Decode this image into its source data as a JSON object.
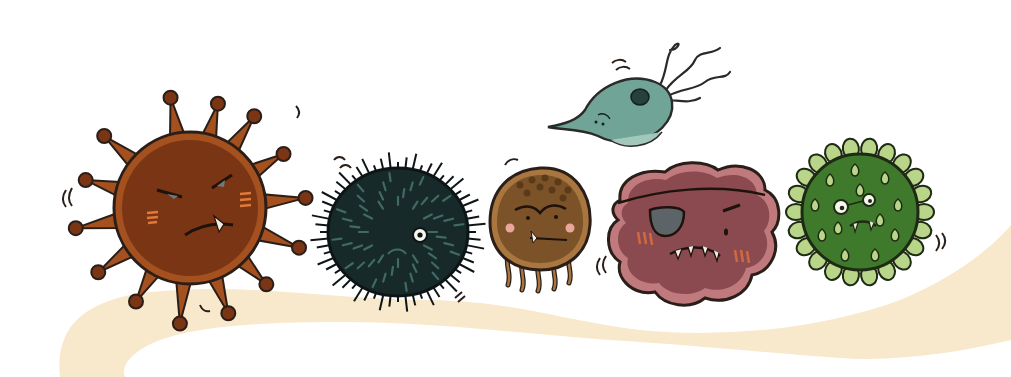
{
  "illustration": {
    "title": "Cartoon microbes",
    "background_color": "#ffffff",
    "path_color": "#f8e8cc",
    "outline_color": "#2a1e18",
    "characters": [
      {
        "id": "brown-spiky-virus",
        "description": "Brown round virus with knobbed spikes, grumpy face",
        "body_color": "#7a3514",
        "highlight_color": "#a4501f",
        "cheek_color": "#d9773a"
      },
      {
        "id": "black-spiny-microbe",
        "description": "Dark spiny ball with one white eye",
        "body_color": "#18292a",
        "spine_color": "#3f6b62"
      },
      {
        "id": "brown-tentacled-microbe",
        "description": "Brown round microbe with small tentacles and one fang",
        "body_color": "#7c5228",
        "rim_color": "#a8763e",
        "cheek_color": "#e8a79a"
      },
      {
        "id": "teal-flagellate",
        "description": "Teal flagellated protozoan floating above",
        "body_color": "#6fa496",
        "nucleus_color": "#26403b"
      },
      {
        "id": "mauve-pirate-blob",
        "description": "Mauve blob with eye patch and jagged teeth",
        "body_color": "#8a4a50",
        "rim_color": "#c07a7e",
        "patch_color": "#5d6467",
        "cheek_color": "#d06a3e"
      },
      {
        "id": "green-virus",
        "description": "Green spherical virus with light-green knobs and glasses",
        "body_color": "#3f7a2c",
        "knob_color": "#b9d58a"
      }
    ]
  }
}
